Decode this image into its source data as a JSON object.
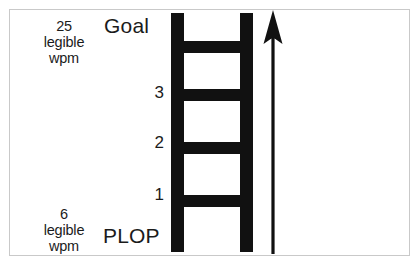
{
  "diagram": {
    "title_top": "Goal",
    "title_bottom": "PLOP",
    "top_annotation": {
      "value": "25",
      "line1": "legible",
      "line2": "wpm"
    },
    "bottom_annotation": {
      "value": "6",
      "line1": "legible",
      "line2": "wpm"
    },
    "ladder": {
      "rungs": [
        {
          "label": "1"
        },
        {
          "label": "2"
        },
        {
          "label": "3"
        }
      ],
      "rung_count": 4,
      "color": "#111111"
    },
    "arrow": {
      "direction": "up",
      "color": "#111111"
    },
    "frame_color": "#c9c9c9",
    "background_color": "#ffffff",
    "text_color": "#1b1b1b"
  }
}
